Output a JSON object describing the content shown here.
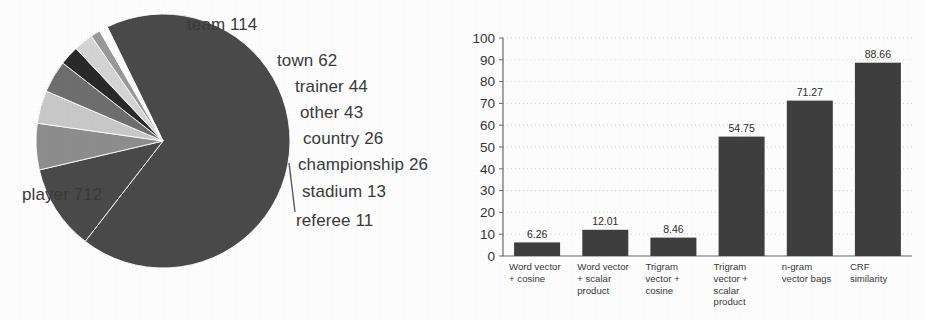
{
  "figure": {
    "background_color": "#ffffff",
    "ink_color": "#3a3a3a"
  },
  "chart_data": [
    {
      "type": "pie",
      "title": "",
      "xlabel": "",
      "ylabel": "",
      "legend_position": "callout-labels",
      "grid": false,
      "total": 1051,
      "categories": [
        "player",
        "team",
        "town",
        "trainer",
        "other",
        "country",
        "championship",
        "stadium",
        "referee"
      ],
      "values": [
        712,
        114,
        62,
        44,
        43,
        26,
        26,
        13,
        11
      ],
      "labels": [
        "player 712",
        "team 114",
        "town 62",
        "trainer 44",
        "other 43",
        "country 26",
        "championship 26",
        "stadium 13",
        "referee 11"
      ],
      "slice_colors": [
        "#4a4a4a",
        "#4a4a4a",
        "#8e8e8e",
        "#c9c9c9",
        "#6f6f6f",
        "#2a2a2a",
        "#d5d5d5",
        "#9a9a9a",
        "#ffffff"
      ]
    },
    {
      "type": "bar",
      "title": "",
      "xlabel": "",
      "ylabel": "",
      "grid": true,
      "ylim": [
        0,
        100
      ],
      "ytick_step": 10,
      "ytick_labels": [
        "0",
        "10",
        "20",
        "30",
        "40",
        "50",
        "60",
        "70",
        "80",
        "90",
        "100"
      ],
      "categories": [
        "Word vector + cosine",
        "Word vector + scalar product",
        "Trigram vector + cosine",
        "Trigram vector + scalar product",
        "n-gram vector bags",
        "CRF similarity"
      ],
      "category_lines": [
        [
          "Word vector",
          "+ cosine"
        ],
        [
          "Word vector",
          "+ scalar",
          "product"
        ],
        [
          "Trigram",
          "vector +",
          "cosine"
        ],
        [
          "Trigram",
          "vector +",
          "scalar",
          "product"
        ],
        [
          "n-gram",
          "vector bags"
        ],
        [
          "CRF",
          "similarity"
        ]
      ],
      "values": [
        6.26,
        12.01,
        8.46,
        54.75,
        71.27,
        88.66
      ],
      "value_labels": [
        "6.26",
        "12.01",
        "8.46",
        "54.75",
        "71.27",
        "88.66"
      ],
      "bar_color": "#3f3f3f"
    }
  ]
}
